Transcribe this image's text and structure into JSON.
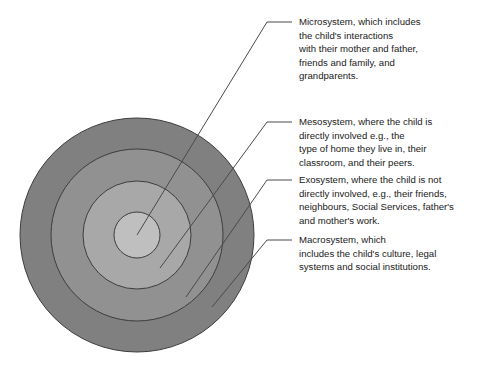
{
  "figure": {
    "background_color": "#ffffff",
    "rings": [
      {
        "id": "macrosystem",
        "label": "Macrosystem",
        "color": "#808080",
        "stroke": "#3d3d3d",
        "radius": 117,
        "order": 1
      },
      {
        "id": "exosystem",
        "label": "Exosystem",
        "color": "#919191",
        "stroke": "#3d3d3d",
        "radius": 86,
        "order": 2
      },
      {
        "id": "mesosystem",
        "label": "Mesosystem",
        "color": "#a8a8a8",
        "stroke": "#3d3d3d",
        "radius": 54,
        "order": 3
      },
      {
        "id": "microsystem",
        "label": "Microsystem",
        "color": "#bfbfbf",
        "stroke": "#3d3d3d",
        "radius": 23,
        "order": 4
      }
    ],
    "center": {
      "x": 137,
      "y": 235
    }
  },
  "callouts": [
    {
      "id": "microsystem",
      "lines": [
        "Microsystem, which includes",
        "the child's interactions",
        "with their mother and father,",
        "friends and family, and",
        "grandparents."
      ]
    },
    {
      "id": "mesosystem",
      "lines": [
        "Mesosystem, where the child is",
        "directly involved e.g., the",
        "type of home they live in, their",
        "classroom, and their peers."
      ]
    },
    {
      "id": "exosystem",
      "lines": [
        "Exosystem, where the child is not",
        "directly involved, e.g., their friends,",
        "neighbours, Social Services, father's",
        "and mother's work."
      ]
    },
    {
      "id": "macrosystem",
      "lines": [
        "Macrosystem, which",
        "includes the child's culture, legal",
        "systems and social institutions."
      ]
    }
  ],
  "colors": {
    "line": "#4a4a4a",
    "text": "#1a1a1a"
  }
}
